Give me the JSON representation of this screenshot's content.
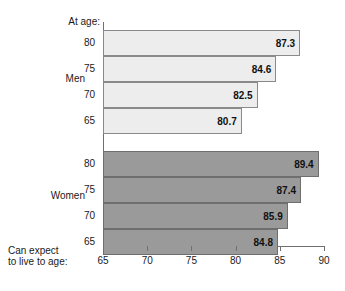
{
  "labels": {
    "at_age": "At age:",
    "bottom_line1": "Can expect",
    "bottom_line2": "to live to age:"
  },
  "groups": {
    "men": "Men",
    "women": "Women"
  },
  "axis": {
    "ticks": [
      "65",
      "70",
      "75",
      "80",
      "85",
      "90"
    ]
  },
  "rows": {
    "men": [
      {
        "age": "80",
        "value": "87.3"
      },
      {
        "age": "75",
        "value": "84.6"
      },
      {
        "age": "70",
        "value": "82.5"
      },
      {
        "age": "65",
        "value": "80.7"
      }
    ],
    "women": [
      {
        "age": "80",
        "value": "89.4"
      },
      {
        "age": "75",
        "value": "87.4"
      },
      {
        "age": "70",
        "value": "85.9"
      },
      {
        "age": "65",
        "value": "84.8"
      }
    ]
  },
  "chart_data": {
    "type": "bar",
    "orientation": "horizontal",
    "title": "",
    "xlabel": "Can expect to live to age:",
    "ylabel": "At age:",
    "xlim": [
      65,
      90
    ],
    "xticks": [
      65,
      70,
      75,
      80,
      85,
      90
    ],
    "grid": false,
    "legend": "none",
    "categories": [
      "80",
      "75",
      "70",
      "65"
    ],
    "series": [
      {
        "name": "Men",
        "color": "#ededed",
        "categories": [
          "80",
          "75",
          "70",
          "65"
        ],
        "values": [
          87.3,
          84.6,
          82.5,
          80.7
        ]
      },
      {
        "name": "Women",
        "color": "#9a9a9a",
        "categories": [
          "80",
          "75",
          "70",
          "65"
        ],
        "values": [
          89.4,
          87.4,
          85.9,
          84.8
        ]
      }
    ]
  },
  "colors": {
    "men_bar": "#ededed",
    "women_bar": "#9a9a9a",
    "axis": "#707070",
    "text": "#1a1a1a"
  }
}
